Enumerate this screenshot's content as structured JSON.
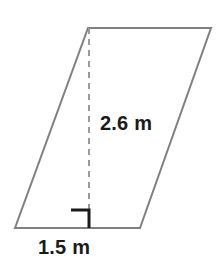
{
  "figure": {
    "name": "parallelogram-with-height",
    "shape_type": "parallelogram",
    "background_color": "#ffffff",
    "outline_color": "#808080",
    "outline_width": 2,
    "fill_color": "#ffffff",
    "vertices": {
      "top_left": [
        88,
        28
      ],
      "top_right": [
        211,
        28
      ],
      "bottom_right": [
        140,
        228
      ],
      "bottom_left": [
        15,
        228
      ]
    },
    "height_line": {
      "name": "dashed-height-line",
      "color": "#9a9a9a",
      "width": 2,
      "dash": "6,5",
      "from": [
        89,
        28
      ],
      "to": [
        89,
        228
      ]
    },
    "right_angle_marker": {
      "name": "right-angle-marker",
      "color": "#1a1a1a",
      "width": 3,
      "size": 18,
      "corner": [
        89,
        228
      ],
      "opens": "left-up"
    },
    "labels": {
      "height": "2.6 m",
      "base": "1.5 m",
      "text_color": "#1a1a1a"
    }
  }
}
